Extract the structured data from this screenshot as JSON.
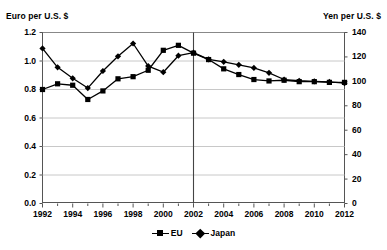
{
  "chart_data": {
    "type": "line",
    "title": "",
    "xlabel": "",
    "ylabel": "Euro per U.S. $",
    "y2label": "Yen per U.S. $",
    "grid": true,
    "legend_position": "bottom-center",
    "xlim": [
      1992,
      2012
    ],
    "ylim": [
      0.0,
      1.2
    ],
    "y2lim": [
      0,
      140
    ],
    "x": [
      1992,
      1993,
      1994,
      1995,
      1996,
      1997,
      1998,
      1999,
      2000,
      2001,
      2002,
      2003,
      2004,
      2005,
      2006,
      2007,
      2008,
      2009,
      2010,
      2011,
      2012
    ],
    "xticks": [
      "1992",
      "1994",
      "1996",
      "1998",
      "2000",
      "2002",
      "2004",
      "2006",
      "2008",
      "2010",
      "2012"
    ],
    "yticks": [
      "0.0",
      "0.2",
      "0.4",
      "0.6",
      "0.8",
      "1.0",
      "1.2"
    ],
    "y2ticks": [
      "0",
      "20",
      "40",
      "60",
      "80",
      "100",
      "120",
      "140"
    ],
    "annotations": [
      {
        "type": "vertical-line",
        "x": 2002,
        "label": ""
      }
    ],
    "series": [
      {
        "name": "EU",
        "axis": "left",
        "marker": "square",
        "values": [
          0.8,
          0.84,
          0.83,
          0.73,
          0.79,
          0.875,
          0.89,
          0.935,
          1.075,
          1.11,
          1.055,
          1.01,
          0.945,
          0.905,
          0.87,
          0.86,
          0.865,
          0.855,
          0.855,
          0.85,
          0.85
        ]
      },
      {
        "name": "Japan",
        "axis": "right",
        "marker": "diamond",
        "values": [
          127.0,
          111.5,
          102.5,
          94.5,
          108.5,
          120.5,
          131.0,
          112.5,
          107.5,
          121.0,
          123.5,
          118.0,
          116.0,
          113.5,
          111.0,
          107.0,
          101.5,
          100.5,
          100.0,
          99.5,
          98.5
        ]
      }
    ]
  },
  "legend": {
    "items": [
      {
        "label": "EU",
        "marker": "square"
      },
      {
        "label": "Japan",
        "marker": "diamond"
      }
    ]
  },
  "colors": {
    "series": "#000000",
    "grid": "#c8c8c8",
    "axis": "#555555",
    "background": "#ffffff"
  }
}
